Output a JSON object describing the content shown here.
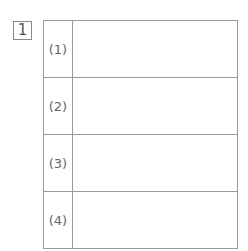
{
  "question": {
    "number": "1"
  },
  "answer_rows": [
    {
      "label": "(1)",
      "value": ""
    },
    {
      "label": "(2)",
      "value": ""
    },
    {
      "label": "(3)",
      "value": ""
    },
    {
      "label": "(4)",
      "value": ""
    }
  ]
}
